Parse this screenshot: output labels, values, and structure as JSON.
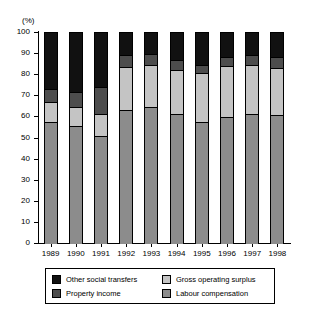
{
  "axis": {
    "unit_label": "(%)",
    "y_ticks": [
      "0",
      "10",
      "20",
      "30",
      "40",
      "50",
      "60",
      "70",
      "80",
      "90",
      "100"
    ],
    "y_min": 0,
    "y_max": 100
  },
  "legend": {
    "items": [
      {
        "label": "Other social transfers",
        "color": "#111111",
        "key": "other_social_transfers"
      },
      {
        "label": "Gross operating surplus",
        "color": "#c4c4c4",
        "key": "gross_operating_surplus"
      },
      {
        "label": "Property income",
        "color": "#4d4d4d",
        "key": "property_income"
      },
      {
        "label": "Labour compensation",
        "color": "#8c8c8c",
        "key": "labour_compensation"
      }
    ]
  },
  "chart_data": {
    "type": "bar",
    "stacked": true,
    "stack_total": 100,
    "title": "",
    "subtitle": "",
    "xlabel": "",
    "ylabel": "(%)",
    "ylim": [
      0,
      100
    ],
    "ytick_step": 10,
    "grid": false,
    "legend_position": "bottom",
    "categories": [
      "1989",
      "1990",
      "1991",
      "1992",
      "1993",
      "1994",
      "1995",
      "1996",
      "1997",
      "1998"
    ],
    "series": [
      {
        "name": "Labour compensation",
        "color": "#8c8c8c",
        "values": [
          57.5,
          55.5,
          50.5,
          63.0,
          64.5,
          61.0,
          57.5,
          59.5,
          61.0,
          60.5
        ]
      },
      {
        "name": "Gross operating surplus",
        "color": "#c4c4c4",
        "values": [
          9.5,
          9.0,
          10.5,
          20.5,
          20.0,
          21.0,
          23.0,
          24.5,
          23.5,
          22.5
        ]
      },
      {
        "name": "Property income",
        "color": "#4d4d4d",
        "values": [
          6.0,
          7.0,
          13.0,
          5.5,
          5.0,
          4.5,
          4.0,
          4.0,
          4.5,
          5.0
        ]
      },
      {
        "name": "Other social transfers",
        "color": "#111111",
        "values": [
          27.0,
          28.5,
          26.0,
          11.0,
          10.5,
          13.5,
          15.5,
          12.0,
          11.0,
          12.0
        ]
      }
    ]
  }
}
